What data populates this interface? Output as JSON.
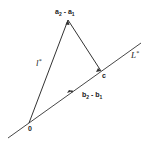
{
  "diagram": {
    "points": {
      "origin": {
        "label": "0"
      },
      "apex": {
        "label": "a",
        "label_sub1": "2",
        "label_mid": " - a",
        "label_sub2": "1"
      },
      "c": {
        "label": "c"
      }
    },
    "segments": {
      "lstar": {
        "label": "l",
        "label_sup": "*"
      },
      "line_L": {
        "label": "L",
        "label_sup": "*"
      },
      "b_vector": {
        "label": "b",
        "label_sub1": "2",
        "label_mid": " - b",
        "label_sub2": "1"
      }
    },
    "stroke_color": "#333333"
  }
}
